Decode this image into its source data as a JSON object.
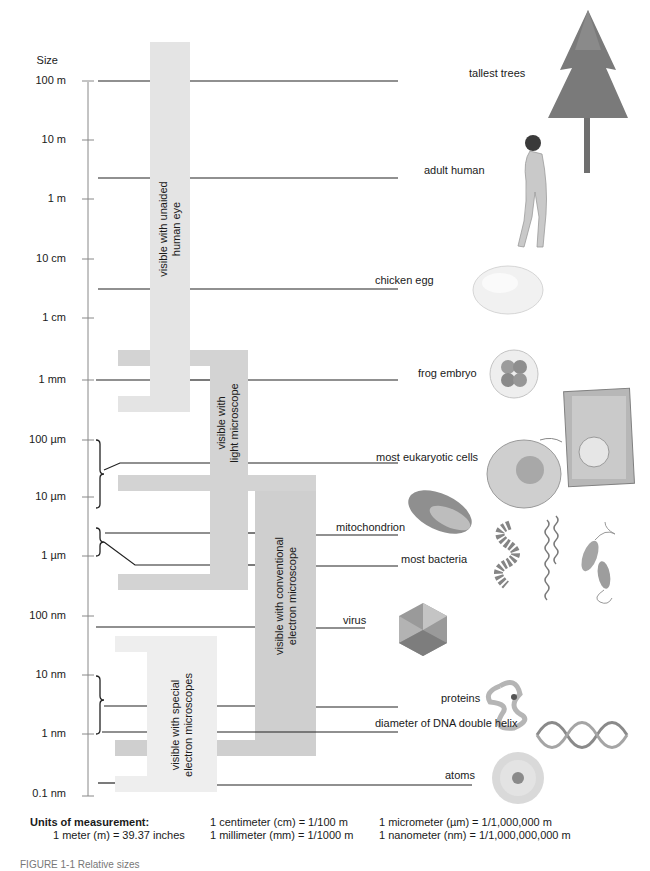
{
  "figure": {
    "axis_title": "Size",
    "caption_partial": "FIGURE 1-1 Relative sizes"
  },
  "scale": [
    {
      "label": "100 m",
      "y": 81
    },
    {
      "label": "10 m",
      "y": 140
    },
    {
      "label": "1 m",
      "y": 199
    },
    {
      "label": "10 cm",
      "y": 259
    },
    {
      "label": "1 cm",
      "y": 318
    },
    {
      "label": "1 mm",
      "y": 380
    },
    {
      "label": "100  µm",
      "y": 440
    },
    {
      "label": "10  µm",
      "y": 497
    },
    {
      "label": "1  µm",
      "y": 556
    },
    {
      "label": "100 nm",
      "y": 616
    },
    {
      "label": "10 nm",
      "y": 675
    },
    {
      "label": "1 nm",
      "y": 734
    },
    {
      "label": "0.1 nm",
      "y": 794
    }
  ],
  "objects": [
    {
      "label": "tallest trees",
      "icon": "tree-icon"
    },
    {
      "label": "adult human",
      "icon": "human-icon"
    },
    {
      "label": "chicken egg",
      "icon": "egg-icon"
    },
    {
      "label": "frog embryo",
      "icon": "frog-embryo-icon"
    },
    {
      "label": "most eukaryotic cells",
      "icon": "eukaryotic-cell-icon"
    },
    {
      "label": "mitochondrion",
      "icon": "mitochondrion-icon"
    },
    {
      "label": "most bacteria",
      "icon": "bacteria-icon"
    },
    {
      "label": "virus",
      "icon": "virus-icon"
    },
    {
      "label": "proteins",
      "icon": "protein-icon"
    },
    {
      "label": "diameter of DNA double helix",
      "icon": "dna-helix-icon"
    },
    {
      "label": "atoms",
      "icon": "atom-icon"
    }
  ],
  "ranges": [
    {
      "label": "visible with unaided human eye",
      "color": "#e4e4e4"
    },
    {
      "label": "visible with light microscope",
      "color": "#d3d3d3"
    },
    {
      "label": "visible with conventional electron microscope",
      "color": "#cfcfcf"
    },
    {
      "label": "visible with special electron microscopes",
      "color": "#eeeeee"
    }
  ],
  "ranges_text": {
    "eye_line1": "visible with unaided",
    "eye_line2": "human eye",
    "light_line1": "visible with",
    "light_line2": "light microscope",
    "conv_line1": "visible with conventional",
    "conv_line2": "electron microscope",
    "special_line1": "visible with special",
    "special_line2": "electron microscopes"
  },
  "units": {
    "title": "Units of measurement:",
    "meter": "1 meter (m) = 39.37 inches",
    "centimeter": "1 centimeter (cm) = 1/100 m",
    "millimeter": "1 millimeter (mm) = 1/1000 m",
    "micrometer": "1 micrometer (µm) = 1/1,000,000 m",
    "nanometer": "1 nanometer (nm) = 1/1,000,000,000 m"
  },
  "colors": {
    "line": "#222222",
    "axis": "#888888"
  }
}
